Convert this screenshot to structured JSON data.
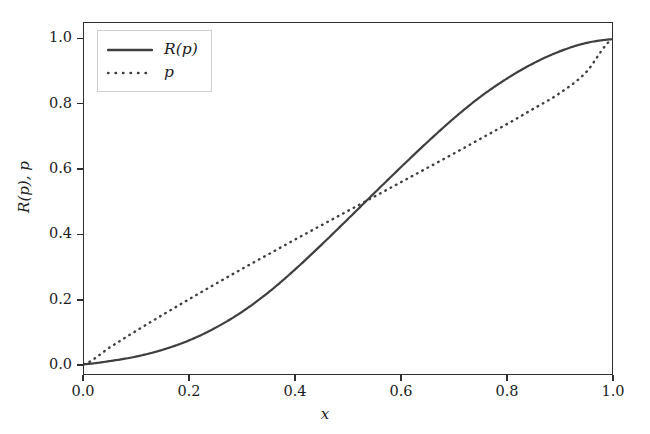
{
  "figure": {
    "background": "#ffffff",
    "line_color": "#3f3f3f",
    "axis_color": "#2f2f2f"
  },
  "axis": {
    "xlabel": "x",
    "ylabel": "R(p), p",
    "xticklabels": [
      "0.0",
      "0.2",
      "0.4",
      "0.6",
      "0.8",
      "1.0"
    ],
    "yticklabels": [
      "0.0",
      "0.2",
      "0.4",
      "0.6",
      "0.8",
      "1.0"
    ]
  },
  "legend": {
    "entries": [
      {
        "label": "R(p)",
        "style": "solid"
      },
      {
        "label": "p",
        "style": "dotted"
      }
    ]
  },
  "chart_data": {
    "type": "line",
    "title": "",
    "xlabel": "x",
    "ylabel": "R(p), p",
    "xlim": [
      0.0,
      1.0
    ],
    "ylim": [
      -0.03,
      1.05
    ],
    "xticks": [
      0.0,
      0.2,
      0.4,
      0.6,
      0.8,
      1.0
    ],
    "yticks": [
      0.0,
      0.2,
      0.4,
      0.6,
      0.8,
      1.0
    ],
    "grid": false,
    "legend_position": "upper left",
    "x": [
      0.0,
      0.05,
      0.1,
      0.15,
      0.2,
      0.25,
      0.3,
      0.35,
      0.4,
      0.45,
      0.5,
      0.55,
      0.6,
      0.65,
      0.7,
      0.75,
      0.8,
      0.85,
      0.9,
      0.95,
      1.0
    ],
    "series": [
      {
        "name": "R(p)",
        "style": "solid",
        "color": "#3f3f3f",
        "linewidth": 2.2,
        "values": [
          0.0,
          0.01,
          0.024,
          0.045,
          0.074,
          0.113,
          0.162,
          0.222,
          0.292,
          0.368,
          0.447,
          0.527,
          0.606,
          0.683,
          0.756,
          0.822,
          0.878,
          0.925,
          0.962,
          0.988,
          1.0
        ]
      },
      {
        "name": "p",
        "style": "dotted",
        "color": "#3f3f3f",
        "linewidth": 2.4,
        "values": [
          0.0,
          0.053,
          0.104,
          0.153,
          0.201,
          0.248,
          0.294,
          0.339,
          0.384,
          0.428,
          0.472,
          0.516,
          0.56,
          0.604,
          0.648,
          0.693,
          0.738,
          0.785,
          0.833,
          0.897,
          1.0
        ]
      }
    ],
    "annotations": [
      {
        "text": "curves intersect near x = 0.62",
        "x": 0.62,
        "y": 0.62
      }
    ]
  }
}
